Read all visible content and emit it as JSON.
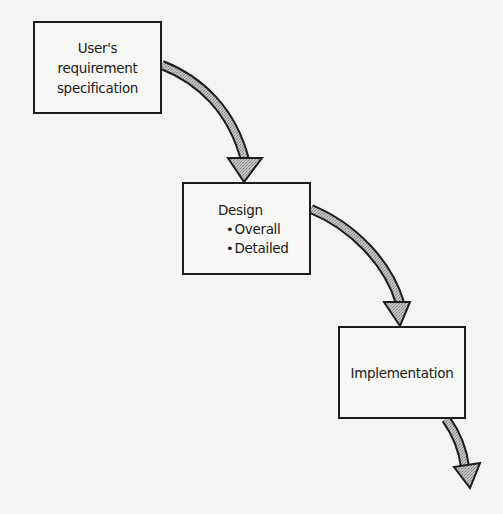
{
  "diagram": {
    "type": "waterfall-flow",
    "colors": {
      "background": "#f4f4f2",
      "box_border": "#1c1c1c",
      "arrow_outline": "#1c1c1c",
      "arrow_fill": "#a9a9a9"
    },
    "stages": [
      {
        "id": "user-requirement-specification",
        "lines": [
          "User's",
          "requirement",
          "specification"
        ]
      },
      {
        "id": "design",
        "title": "Design",
        "bullets": [
          "Overall",
          "Detailed"
        ]
      },
      {
        "id": "implementation",
        "title": "Implementation"
      }
    ],
    "arrows": [
      {
        "from": "user-requirement-specification",
        "to": "design"
      },
      {
        "from": "design",
        "to": "implementation"
      },
      {
        "from": "implementation",
        "to": "next-stage-offscreen"
      }
    ],
    "bullet_glyph": "•"
  }
}
